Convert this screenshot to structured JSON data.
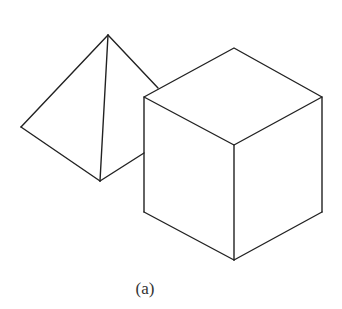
{
  "figure": {
    "caption": "(a)",
    "stroke_color": "#222222",
    "background": "#ffffff",
    "shapes": [
      {
        "name": "pyramid",
        "description": "triangular pyramid partially hidden behind cube"
      },
      {
        "name": "cube",
        "description": "isometric cube in front"
      }
    ]
  }
}
